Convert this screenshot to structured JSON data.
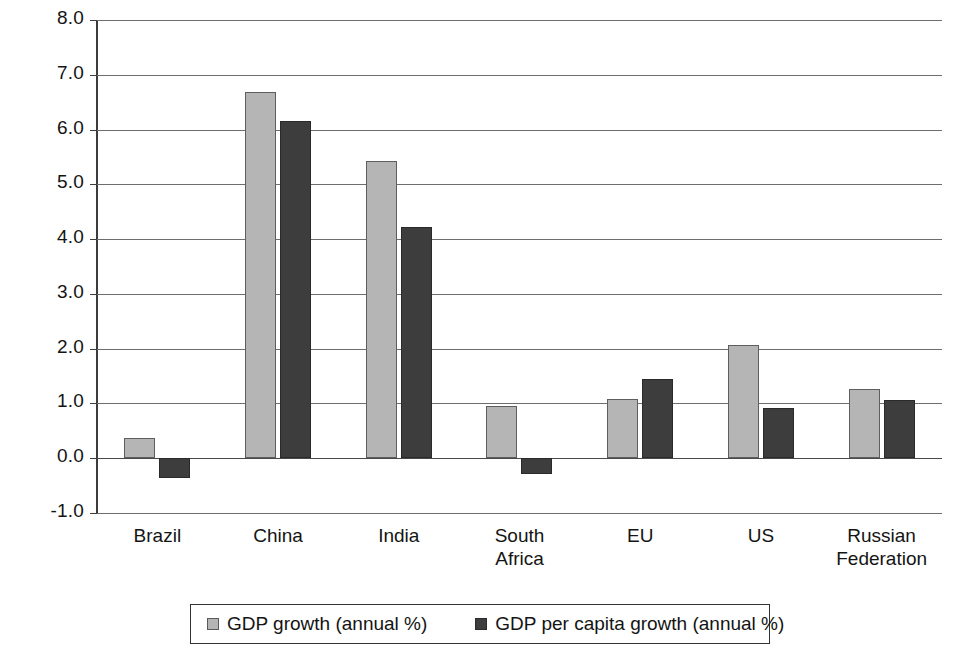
{
  "chart_data": {
    "type": "bar",
    "title": "",
    "subtitle": "",
    "xlabel": "",
    "ylabel": "",
    "ylim": [
      -1.0,
      8.0
    ],
    "ytick_step": 1.0,
    "grid": true,
    "legend_position": "bottom",
    "categories": [
      "Brazil",
      "China",
      "India",
      "South\nAfrica",
      "EU",
      "US",
      "Russian\nFederation"
    ],
    "tick_labels": [
      "8.0",
      "7.0",
      "6.0",
      "5.0",
      "4.0",
      "3.0",
      "2.0",
      "1.0",
      "0.0",
      "-1.0"
    ],
    "tick_values": [
      8.0,
      7.0,
      6.0,
      5.0,
      4.0,
      3.0,
      2.0,
      1.0,
      0.0,
      -1.0
    ],
    "series": [
      {
        "name": "GDP growth (annual %)",
        "color": "#b5b5b5",
        "values": [
          0.37,
          6.68,
          5.42,
          0.95,
          1.09,
          2.06,
          1.27
        ]
      },
      {
        "name": "GDP per capita growth (annual %)",
        "color": "#3d3d3d",
        "values": [
          -0.37,
          6.15,
          4.23,
          -0.28,
          1.44,
          0.92,
          1.06
        ]
      }
    ]
  },
  "legend": {
    "items": [
      {
        "label": "GDP growth (annual %)",
        "swatch": "light-gray-square"
      },
      {
        "label": "GDP per capita growth (annual %)",
        "swatch": "dark-gray-square"
      }
    ]
  }
}
